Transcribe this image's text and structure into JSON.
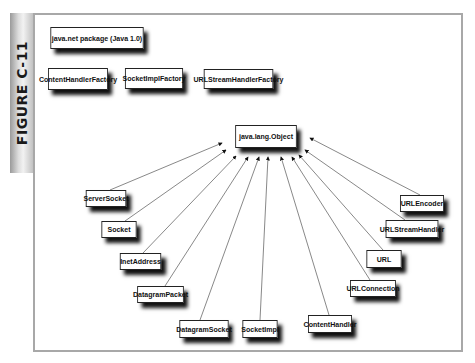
{
  "figure_label": "FIGURE C-11",
  "title_box": "java.net package (Java 1.0)",
  "interfaces": [
    "ContentHandlerFactory",
    "SocketImplFactory",
    "URLStreamHandlerFactory"
  ],
  "root_class": "java.lang.Object",
  "classes": [
    "ServerSocket",
    "Socket",
    "InetAddress",
    "DatagramPacket",
    "DatagramSocket",
    "SocketImpl",
    "ContentHandler",
    "URLConnection",
    "URL",
    "URLStreamHandler",
    "URLEncoder"
  ],
  "colors": {
    "frame": "#a8a8a8",
    "box_border": "#222222",
    "shadow": "#111111",
    "line": "#555555"
  }
}
